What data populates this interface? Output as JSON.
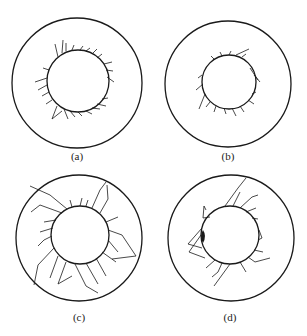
{
  "figure": {
    "panels": [
      {
        "id": "a",
        "label": "(a)",
        "outer": {
          "cx": 77,
          "cy": 83,
          "r": 65
        },
        "inner": {
          "cx": 78,
          "cy": 81,
          "r": 31
        },
        "label_pos": {
          "x": 77,
          "y": 150
        },
        "crack_severity": "short-dense"
      },
      {
        "id": "b",
        "label": "(b)",
        "outer": {
          "cx": 228,
          "cy": 84,
          "r": 63
        },
        "inner": {
          "cx": 229,
          "cy": 82,
          "r": 27
        },
        "label_pos": {
          "x": 228,
          "y": 150
        },
        "crack_severity": "short-sparse"
      },
      {
        "id": "c",
        "label": "(c)",
        "outer": {
          "cx": 79,
          "cy": 238,
          "r": 63
        },
        "inner": {
          "cx": 80,
          "cy": 235,
          "r": 29
        },
        "label_pos": {
          "x": 79,
          "y": 311
        },
        "crack_severity": "long-radial"
      },
      {
        "id": "d",
        "label": "(d)",
        "outer": {
          "cx": 231,
          "cy": 238,
          "r": 63
        },
        "inner": {
          "cx": 230,
          "cy": 235,
          "r": 29
        },
        "label_pos": {
          "x": 230,
          "y": 311
        },
        "crack_severity": "medium-long"
      }
    ],
    "colors": {
      "stroke": "#1a1a1a",
      "background": "#ffffff"
    }
  }
}
